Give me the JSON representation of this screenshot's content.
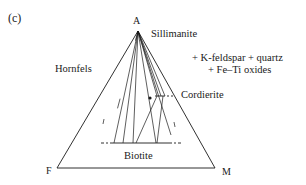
{
  "figure": {
    "panel_label": "(c)",
    "vertices": {
      "apex": "A",
      "left": "F",
      "right": "M"
    },
    "phases": {
      "top": "Sillimanite",
      "right": "Cordierite",
      "bottom": "Biotite"
    },
    "field_label": "Hornfels",
    "additional_phases": {
      "line1": "+ K-feldspar + quartz",
      "line2": "+ Fe–Ti oxides"
    },
    "colors": {
      "line": "#1a1a1a",
      "background": "#ffffff"
    }
  }
}
